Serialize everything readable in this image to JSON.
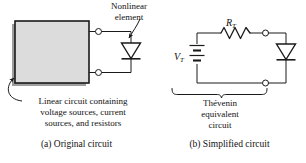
{
  "figure": {
    "type": "circuit-diagram",
    "background_color": "#ffffff",
    "line_color": "#1a1a1a",
    "box_fill_color": "#dcdcdc",
    "box_border_color": "#1a1a1a",
    "shadow_color": "#9a9a9a"
  },
  "panel_a": {
    "caption": "(a) Original circuit",
    "box_annotation": {
      "line1": "Linear circuit containing",
      "line2": "voltage sources, current",
      "line3": "sources, and resistors"
    },
    "element_annotation": {
      "line1": "Nonlinear",
      "line2": "element"
    },
    "symbols": {
      "box": "linear-circuit-block",
      "diode": "nonlinear-element-diode",
      "terminals": 2
    }
  },
  "panel_b": {
    "caption": "(b) Simplified circuit",
    "brace_annotation": {
      "line1": "Thévenin",
      "line2": "equivalent",
      "line3": "circuit"
    },
    "labels": {
      "resistor": "R",
      "resistor_sub": "T",
      "source": "V",
      "source_sub": "T"
    },
    "symbols": {
      "resistor": "resistor-zigzag",
      "source": "battery-dc-source",
      "diode": "nonlinear-element-diode",
      "terminals": 2,
      "brace": "curly-brace"
    }
  }
}
